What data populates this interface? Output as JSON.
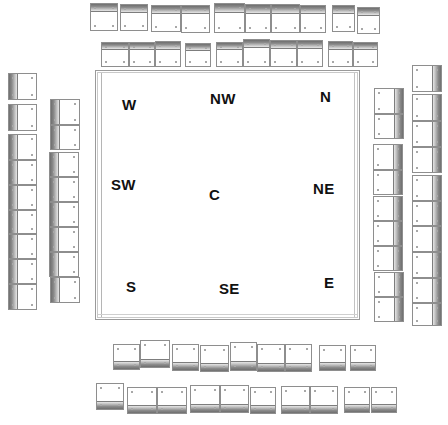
{
  "figure": {
    "type": "architectural-plan-schematic",
    "background_color": "#ffffff",
    "line_color": "#8e8e8e",
    "shade_color": "#6f6f6f",
    "label_color": "#111111",
    "width": 448,
    "height": 425
  },
  "courtyard": {
    "name": "central-courtyard",
    "x": 95,
    "y": 70,
    "w": 265,
    "h": 250,
    "labels": [
      {
        "id": "w",
        "text": "W",
        "x": 122,
        "y": 96,
        "size": 15
      },
      {
        "id": "nw",
        "text": "NW",
        "x": 210,
        "y": 90,
        "size": 15
      },
      {
        "id": "n",
        "text": "N",
        "x": 320,
        "y": 88,
        "size": 15
      },
      {
        "id": "sw",
        "text": "SW",
        "x": 111,
        "y": 176,
        "size": 15
      },
      {
        "id": "c",
        "text": "C",
        "x": 209,
        "y": 186,
        "size": 15
      },
      {
        "id": "ne",
        "text": "NE",
        "x": 313,
        "y": 180,
        "size": 15
      },
      {
        "id": "s",
        "text": "S",
        "x": 126,
        "y": 278,
        "size": 15
      },
      {
        "id": "se",
        "text": "SE",
        "x": 219,
        "y": 280,
        "size": 15
      },
      {
        "id": "e",
        "text": "E",
        "x": 324,
        "y": 274,
        "size": 15
      }
    ]
  },
  "ranges": [
    {
      "id": "top-outer-row",
      "name": "top-outer-range",
      "orientation": "horizontal",
      "band": "top",
      "cells": [
        {
          "x": 90,
          "y": 3,
          "w": 28,
          "h": 28
        },
        {
          "x": 120,
          "y": 4,
          "w": 28,
          "h": 27
        },
        {
          "x": 151,
          "y": 5,
          "w": 30,
          "h": 27
        },
        {
          "x": 181,
          "y": 5,
          "w": 29,
          "h": 28
        },
        {
          "x": 214,
          "y": 3,
          "w": 31,
          "h": 30
        },
        {
          "x": 245,
          "y": 4,
          "w": 26,
          "h": 29
        },
        {
          "x": 271,
          "y": 4,
          "w": 29,
          "h": 29
        },
        {
          "x": 300,
          "y": 5,
          "w": 26,
          "h": 28
        },
        {
          "x": 332,
          "y": 5,
          "w": 23,
          "h": 27
        },
        {
          "x": 357,
          "y": 7,
          "w": 23,
          "h": 27
        }
      ]
    },
    {
      "id": "top-inner-row",
      "name": "top-inner-range",
      "orientation": "horizontal",
      "band": "top",
      "cells": [
        {
          "x": 101,
          "y": 42,
          "w": 28,
          "h": 25
        },
        {
          "x": 129,
          "y": 42,
          "w": 26,
          "h": 25
        },
        {
          "x": 155,
          "y": 41,
          "w": 26,
          "h": 26
        },
        {
          "x": 185,
          "y": 43,
          "w": 26,
          "h": 24
        },
        {
          "x": 216,
          "y": 42,
          "w": 27,
          "h": 25
        },
        {
          "x": 243,
          "y": 39,
          "w": 27,
          "h": 28
        },
        {
          "x": 270,
          "y": 40,
          "w": 27,
          "h": 27
        },
        {
          "x": 297,
          "y": 40,
          "w": 26,
          "h": 27
        },
        {
          "x": 328,
          "y": 41,
          "w": 25,
          "h": 26
        },
        {
          "x": 353,
          "y": 42,
          "w": 25,
          "h": 25
        }
      ]
    },
    {
      "id": "left-outer-column",
      "name": "left-outer-range",
      "orientation": "vertical",
      "band": "left",
      "cells": [
        {
          "x": 8,
          "y": 73,
          "w": 29,
          "h": 27
        },
        {
          "x": 8,
          "y": 104,
          "w": 29,
          "h": 27
        },
        {
          "x": 8,
          "y": 134,
          "w": 29,
          "h": 26
        },
        {
          "x": 8,
          "y": 160,
          "w": 29,
          "h": 25
        },
        {
          "x": 8,
          "y": 185,
          "w": 29,
          "h": 25
        },
        {
          "x": 8,
          "y": 210,
          "w": 29,
          "h": 24
        },
        {
          "x": 8,
          "y": 234,
          "w": 29,
          "h": 25
        },
        {
          "x": 8,
          "y": 259,
          "w": 29,
          "h": 25
        },
        {
          "x": 8,
          "y": 284,
          "w": 29,
          "h": 26
        }
      ]
    },
    {
      "id": "left-inner-column",
      "name": "left-inner-range",
      "orientation": "vertical",
      "band": "left",
      "cells": [
        {
          "x": 50,
          "y": 99,
          "w": 30,
          "h": 26
        },
        {
          "x": 50,
          "y": 125,
          "w": 30,
          "h": 25
        },
        {
          "x": 49,
          "y": 152,
          "w": 30,
          "h": 25
        },
        {
          "x": 49,
          "y": 177,
          "w": 30,
          "h": 25
        },
        {
          "x": 49,
          "y": 202,
          "w": 30,
          "h": 25
        },
        {
          "x": 49,
          "y": 227,
          "w": 30,
          "h": 25
        },
        {
          "x": 49,
          "y": 252,
          "w": 30,
          "h": 25
        },
        {
          "x": 50,
          "y": 277,
          "w": 30,
          "h": 26
        }
      ]
    },
    {
      "id": "right-inner-column",
      "name": "right-inner-range",
      "orientation": "vertical",
      "band": "right",
      "cells": [
        {
          "x": 374,
          "y": 88,
          "w": 30,
          "h": 26
        },
        {
          "x": 374,
          "y": 114,
          "w": 30,
          "h": 25
        },
        {
          "x": 373,
          "y": 144,
          "w": 30,
          "h": 26
        },
        {
          "x": 373,
          "y": 170,
          "w": 30,
          "h": 25
        },
        {
          "x": 373,
          "y": 196,
          "w": 30,
          "h": 25
        },
        {
          "x": 373,
          "y": 221,
          "w": 30,
          "h": 25
        },
        {
          "x": 373,
          "y": 246,
          "w": 30,
          "h": 25
        },
        {
          "x": 374,
          "y": 272,
          "w": 30,
          "h": 25
        },
        {
          "x": 374,
          "y": 297,
          "w": 30,
          "h": 25
        }
      ]
    },
    {
      "id": "right-outer-column",
      "name": "right-outer-range",
      "orientation": "vertical",
      "band": "right",
      "cells": [
        {
          "x": 412,
          "y": 65,
          "w": 30,
          "h": 27
        },
        {
          "x": 412,
          "y": 94,
          "w": 30,
          "h": 27
        },
        {
          "x": 412,
          "y": 121,
          "w": 30,
          "h": 26
        },
        {
          "x": 412,
          "y": 147,
          "w": 30,
          "h": 26
        },
        {
          "x": 412,
          "y": 175,
          "w": 30,
          "h": 26
        },
        {
          "x": 412,
          "y": 201,
          "w": 30,
          "h": 25
        },
        {
          "x": 412,
          "y": 226,
          "w": 30,
          "h": 26
        },
        {
          "x": 412,
          "y": 252,
          "w": 30,
          "h": 26
        },
        {
          "x": 412,
          "y": 278,
          "w": 30,
          "h": 25
        },
        {
          "x": 412,
          "y": 303,
          "w": 30,
          "h": 23
        }
      ]
    },
    {
      "id": "bottom-inner-row",
      "name": "bottom-inner-range",
      "orientation": "horizontal",
      "band": "bottom",
      "cells": [
        {
          "x": 113,
          "y": 344,
          "w": 27,
          "h": 26
        },
        {
          "x": 140,
          "y": 340,
          "w": 30,
          "h": 28
        },
        {
          "x": 172,
          "y": 344,
          "w": 27,
          "h": 27
        },
        {
          "x": 200,
          "y": 345,
          "w": 29,
          "h": 27
        },
        {
          "x": 230,
          "y": 342,
          "w": 27,
          "h": 29
        },
        {
          "x": 257,
          "y": 344,
          "w": 28,
          "h": 28
        },
        {
          "x": 285,
          "y": 344,
          "w": 27,
          "h": 28
        },
        {
          "x": 319,
          "y": 345,
          "w": 27,
          "h": 26
        },
        {
          "x": 350,
          "y": 345,
          "w": 26,
          "h": 26
        }
      ]
    },
    {
      "id": "bottom-outer-row",
      "name": "bottom-outer-range",
      "orientation": "horizontal",
      "band": "bottom",
      "cells": [
        {
          "x": 96,
          "y": 383,
          "w": 28,
          "h": 27
        },
        {
          "x": 127,
          "y": 387,
          "w": 30,
          "h": 27
        },
        {
          "x": 157,
          "y": 387,
          "w": 30,
          "h": 27
        },
        {
          "x": 190,
          "y": 385,
          "w": 30,
          "h": 28
        },
        {
          "x": 220,
          "y": 385,
          "w": 29,
          "h": 28
        },
        {
          "x": 250,
          "y": 387,
          "w": 26,
          "h": 27
        },
        {
          "x": 281,
          "y": 386,
          "w": 29,
          "h": 28
        },
        {
          "x": 310,
          "y": 386,
          "w": 28,
          "h": 28
        },
        {
          "x": 344,
          "y": 387,
          "w": 26,
          "h": 26
        },
        {
          "x": 371,
          "y": 387,
          "w": 26,
          "h": 26
        }
      ]
    }
  ]
}
